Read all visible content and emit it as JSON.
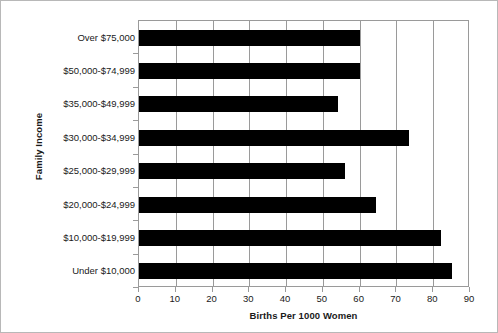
{
  "chart_data": {
    "type": "bar",
    "orientation": "horizontal",
    "title": "",
    "xlabel": "Births Per 1000 Women",
    "ylabel": "Family Income",
    "categories": [
      "Under $10,000",
      "$10,000-$19,999",
      "$20,000-$24,999",
      "$25,000-$29,999",
      "$30,000-$34,999",
      "$35,000-$49,999",
      "$50,000-$74,999",
      "Over $75,000"
    ],
    "values": [
      85,
      82,
      64.5,
      56,
      73.5,
      54,
      60,
      60
    ],
    "xlim": [
      0,
      90
    ],
    "xticks": [
      0,
      10,
      20,
      30,
      40,
      50,
      60,
      70,
      80,
      90
    ],
    "xticklabels": [
      "0",
      "10",
      "20",
      "30",
      "40",
      "50",
      "60",
      "70",
      "80",
      "90"
    ],
    "grid": "vertical",
    "legend": "none",
    "bar_color": "#000000",
    "axis_color": "#9a9a9a",
    "text_color": "#1a1a1a"
  }
}
